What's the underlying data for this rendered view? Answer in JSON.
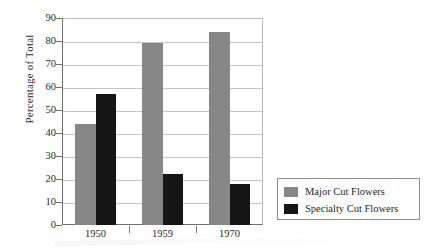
{
  "chart_data": {
    "type": "bar",
    "title": "",
    "xlabel": "",
    "ylabel": "Percentage of Total",
    "ylim": [
      0,
      90
    ],
    "ytick_step": 10,
    "yticks": [
      "90",
      "80",
      "70",
      "60",
      "50",
      "40",
      "30",
      "20",
      "10",
      "0"
    ],
    "grid": true,
    "legend_position": "right-bottom-outside",
    "categories": [
      "1950",
      "1959",
      "1970"
    ],
    "series": [
      {
        "name": "Major Cut Flowers",
        "color": "#878787",
        "values": [
          44,
          79,
          84
        ]
      },
      {
        "name": "Specialty Cut Flowers",
        "color": "#151515",
        "values": [
          57,
          22,
          18
        ]
      }
    ]
  },
  "legend": {
    "entries": [
      {
        "label": "Major Cut Flowers",
        "swatch": "major"
      },
      {
        "label": "Specialty Cut Flowers",
        "swatch": "specialty"
      }
    ]
  },
  "colors": {
    "major": "#878787",
    "specialty": "#151515",
    "axis": "#6f6f6f",
    "grid": "#c4c4c4",
    "text": "#1f1f1f"
  }
}
